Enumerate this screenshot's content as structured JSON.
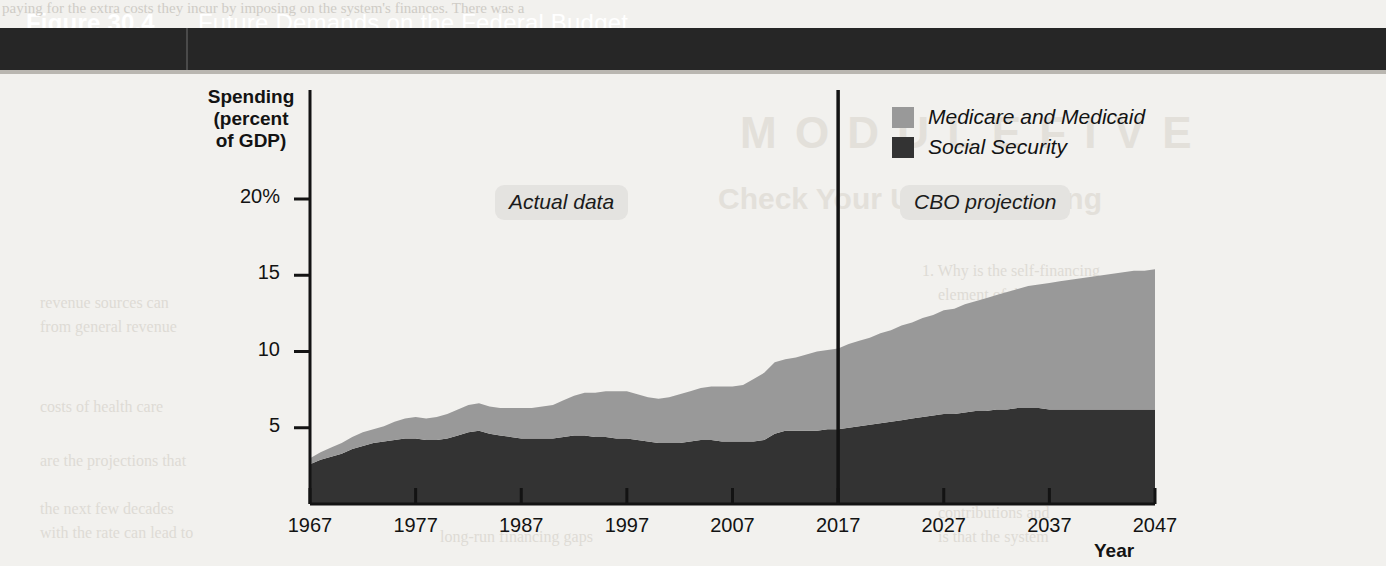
{
  "page": {
    "bleed_top_line": "paying for the extra costs they incur by imposing on the system's finances. There was a",
    "bleed_texts": [
      "M O D U L E   F I V E",
      "Check Your Understanding",
      "1. Why is the self-financing",
      "element of the system",
      "policy makers to consider",
      "2. Explain the economic",
      "a balanced amortization",
      "taxes were not being",
      "held to fund future",
      "social insurance",
      "have sufficient assets",
      "the consequences of",
      "contributions and",
      "is that the system",
      "revenue sources can",
      "from general revenue",
      "costs of health care",
      "are the projections that",
      "the next few decades",
      "with the rate can lead to",
      "long-run financing gaps"
    ]
  },
  "figure": {
    "number": "Figure 30.4",
    "title": "Future Demands on the Federal Budget"
  },
  "chart_data": {
    "type": "area",
    "title": "Future Demands on the Federal Budget",
    "xlabel": "Year",
    "ylabel": "Spending (percent of GDP)",
    "ylabel_lines": [
      "Spending",
      "(percent",
      "of GDP)"
    ],
    "xlim": [
      1967,
      2047
    ],
    "ylim": [
      0,
      22
    ],
    "grid": false,
    "legend_position": "top-right",
    "stacked": true,
    "x_ticks": [
      1967,
      1977,
      1987,
      1997,
      2007,
      2017,
      2027,
      2037,
      2047
    ],
    "y_ticks": [
      "5",
      "10",
      "15",
      "20%"
    ],
    "y_tick_values": [
      5,
      10,
      15,
      20
    ],
    "divider_year": 2017,
    "annotations": [
      {
        "text": "Actual data",
        "year_range": [
          1967,
          2017
        ]
      },
      {
        "text": "CBO projection",
        "year_range": [
          2017,
          2047
        ]
      }
    ],
    "series": [
      {
        "name": "Social Security",
        "color": "#333333",
        "values": [
          2.6,
          2.9,
          3.1,
          3.3,
          3.6,
          3.8,
          4.0,
          4.1,
          4.2,
          4.3,
          4.3,
          4.2,
          4.2,
          4.3,
          4.5,
          4.7,
          4.8,
          4.6,
          4.5,
          4.4,
          4.3,
          4.3,
          4.3,
          4.3,
          4.4,
          4.5,
          4.5,
          4.4,
          4.4,
          4.3,
          4.3,
          4.2,
          4.1,
          4.0,
          4.0,
          4.0,
          4.1,
          4.2,
          4.2,
          4.1,
          4.1,
          4.1,
          4.1,
          4.2,
          4.6,
          4.8,
          4.8,
          4.8,
          4.8,
          4.9,
          4.9,
          5.0,
          5.1,
          5.2,
          5.3,
          5.4,
          5.5,
          5.6,
          5.7,
          5.8,
          5.9,
          5.9,
          6.0,
          6.1,
          6.1,
          6.2,
          6.2,
          6.3,
          6.3,
          6.3,
          6.2,
          6.2,
          6.2,
          6.2,
          6.2,
          6.2,
          6.2,
          6.2,
          6.2,
          6.2,
          6.2
        ]
      },
      {
        "name": "Medicare and Medicaid",
        "color": "#999999",
        "values": [
          0.4,
          0.5,
          0.6,
          0.7,
          0.8,
          0.9,
          0.9,
          1.0,
          1.2,
          1.3,
          1.4,
          1.4,
          1.5,
          1.6,
          1.7,
          1.8,
          1.8,
          1.8,
          1.8,
          1.9,
          2.0,
          2.0,
          2.1,
          2.2,
          2.4,
          2.6,
          2.8,
          2.9,
          3.0,
          3.1,
          3.1,
          3.0,
          2.9,
          2.9,
          3.0,
          3.2,
          3.3,
          3.4,
          3.5,
          3.6,
          3.6,
          3.7,
          4.1,
          4.4,
          4.7,
          4.7,
          4.8,
          5.0,
          5.2,
          5.2,
          5.3,
          5.5,
          5.6,
          5.7,
          5.9,
          6.0,
          6.2,
          6.3,
          6.5,
          6.6,
          6.8,
          6.9,
          7.1,
          7.2,
          7.4,
          7.5,
          7.7,
          7.8,
          8.0,
          8.1,
          8.3,
          8.4,
          8.5,
          8.6,
          8.7,
          8.8,
          8.9,
          9.0,
          9.1,
          9.1,
          9.2
        ]
      }
    ],
    "totals_at_ticks": {
      "1967": 3.0,
      "1977": 5.3,
      "1987": 6.3,
      "1997": 7.3,
      "2007": 7.7,
      "2017": 10.3,
      "2027": 11.5,
      "2037": 13.3,
      "2047": 15.4
    },
    "legend": [
      {
        "label": "Medicare and Medicaid",
        "color": "#999999"
      },
      {
        "label": "Social Security",
        "color": "#333333"
      }
    ]
  }
}
